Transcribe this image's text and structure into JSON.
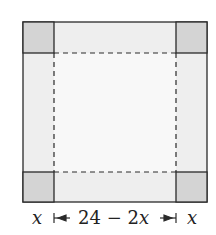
{
  "diagram": {
    "colors": {
      "sheet": "#f0f0f0",
      "center": "#f8f8f8",
      "corner": "#d4d4d4",
      "stroke": "#2a2a2a"
    },
    "labels": {
      "left_x": "x",
      "middle": "24 − 2x",
      "middle_num": "24 − 2",
      "middle_var": "x",
      "right_x": "x"
    }
  }
}
